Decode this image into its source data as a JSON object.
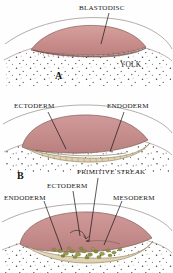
{
  "figure": {
    "background_color": "#fefefe",
    "width": 173,
    "height": 273
  },
  "colors": {
    "blastodisc_fill": "#c98e8c",
    "blastodisc_fill_light": "#d9a3a0",
    "ectoderm_fill": "#c98e8c",
    "endoderm_fill": "#e8dcc0",
    "mesoderm_cells": "#8c9440",
    "yolk_fill": "#ffffff",
    "yolk_speckle": "#4a4a4a",
    "outline": "#4a3b33",
    "leader_line": "#141414",
    "text": "#1a1a1a"
  },
  "panels": [
    {
      "id": "panel-a",
      "letter": "A",
      "letter_x": 55,
      "letter_y": 72,
      "labels": [
        {
          "name": "blastodisc",
          "text": "BLASTODISC",
          "x": 79,
          "y": 6,
          "leader": {
            "x1": 109,
            "y1": 12,
            "x2": 101,
            "y2": 43
          }
        },
        {
          "name": "yolk",
          "text": "YOLK",
          "x": 120,
          "y": 62,
          "leader": null
        }
      ]
    },
    {
      "id": "panel-middle",
      "letter": "",
      "labels": [
        {
          "name": "ectoderm",
          "text": "ECTODERM",
          "x": 14,
          "y": 104,
          "leader": {
            "x1": 48,
            "y1": 111,
            "x2": 66,
            "y2": 148
          }
        },
        {
          "name": "endoderm",
          "text": "ENDODERM",
          "x": 107,
          "y": 104,
          "leader": {
            "x1": 124,
            "y1": 111,
            "x2": 110,
            "y2": 148
          }
        }
      ]
    },
    {
      "id": "panel-b",
      "letter": "B",
      "letter_x": 17,
      "letter_y": 172,
      "labels": [
        {
          "name": "primitive-streak",
          "text": "PRIMITIVE STREAK",
          "x": 77,
          "y": 170,
          "leader": {
            "x1": 98,
            "y1": 177,
            "x2": 90,
            "y2": 212
          }
        },
        {
          "name": "ectoderm",
          "text": "ECTODERM",
          "x": 47,
          "y": 184,
          "leader": {
            "x1": 72,
            "y1": 191,
            "x2": 80,
            "y2": 214
          }
        },
        {
          "name": "endoderm",
          "text": "ENDODERM",
          "x": 4,
          "y": 196,
          "leader": {
            "x1": 44,
            "y1": 201,
            "x2": 62,
            "y2": 238
          }
        },
        {
          "name": "mesoderm",
          "text": "MESODERM",
          "x": 113,
          "y": 196,
          "leader": {
            "x1": 122,
            "y1": 201,
            "x2": 104,
            "y2": 226
          }
        }
      ]
    }
  ]
}
